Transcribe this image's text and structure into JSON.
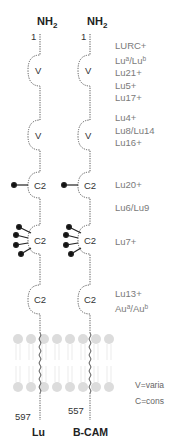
{
  "proteins": [
    {
      "name": "Lu",
      "n_term": "NH",
      "n_term_sub": "2",
      "start": "1",
      "end": "597"
    },
    {
      "name": "B-CAM",
      "n_term": "NH",
      "n_term_sub": "2",
      "start": "1",
      "end": "557"
    }
  ],
  "domains": [
    {
      "type": "V",
      "label": "V"
    },
    {
      "type": "V",
      "label": "V"
    },
    {
      "type": "C2",
      "label": "C2",
      "glycans": 1
    },
    {
      "type": "C2",
      "label": "C2",
      "glycans": 4
    },
    {
      "type": "C2",
      "label": "C2",
      "glycans": 0
    }
  ],
  "epitope_groups": [
    {
      "items": [
        "LURC+",
        "Lu",
        "Lu21+",
        "Lu5+",
        "Lu17+"
      ],
      "lu_ab": {
        "a": "a",
        "sep": "/Lu",
        "b": "b"
      }
    },
    {
      "items": [
        "Lu4+",
        "Lu8/Lu14",
        "Lu16+"
      ]
    },
    {
      "items": [
        "Lu20+"
      ]
    },
    {
      "items": [
        "Lu6/Lu9"
      ]
    },
    {
      "items": [
        "Lu7+"
      ]
    },
    {
      "items": [
        "Lu13+",
        "Au"
      ],
      "au_ab": {
        "a": "a",
        "sep": "/Au",
        "b": "b"
      }
    }
  ],
  "legend": {
    "v": "V=varia",
    "c": "C=cons"
  },
  "colors": {
    "line": "#555555",
    "membrane": "#d9d9d9",
    "text_gray": "#7a7a7a"
  }
}
